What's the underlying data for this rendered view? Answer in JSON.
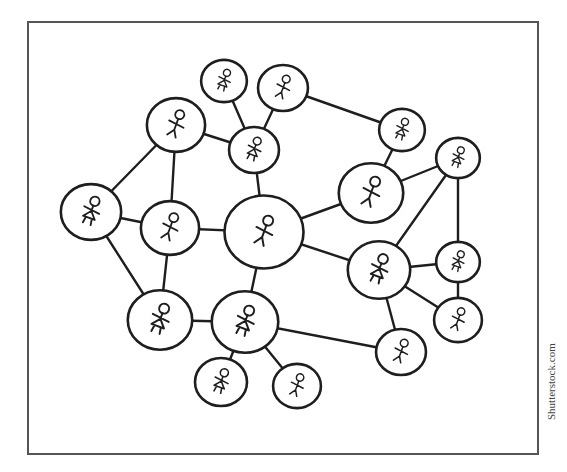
{
  "diagram": {
    "title": "",
    "frame": {
      "x": 28,
      "y": 22,
      "width": 510,
      "height": 432
    },
    "colors": {
      "ink": "#1e1e1e",
      "frame": "#555555",
      "background": "#ffffff"
    },
    "nodes": [
      {
        "id": "A",
        "x": 176,
        "y": 125,
        "r": 28,
        "figure": "male"
      },
      {
        "id": "B",
        "x": 224,
        "y": 81,
        "r": 22,
        "figure": "female"
      },
      {
        "id": "C",
        "x": 283,
        "y": 88,
        "r": 24,
        "figure": "male"
      },
      {
        "id": "D",
        "x": 254,
        "y": 150,
        "r": 24,
        "figure": "female"
      },
      {
        "id": "E",
        "x": 402,
        "y": 130,
        "r": 22,
        "figure": "female"
      },
      {
        "id": "F",
        "x": 371,
        "y": 193,
        "r": 31,
        "figure": "male"
      },
      {
        "id": "G",
        "x": 458,
        "y": 158,
        "r": 21,
        "figure": "female"
      },
      {
        "id": "H",
        "x": 91,
        "y": 212,
        "r": 29,
        "figure": "female"
      },
      {
        "id": "I",
        "x": 170,
        "y": 228,
        "r": 28,
        "figure": "male"
      },
      {
        "id": "J",
        "x": 264,
        "y": 232,
        "r": 38,
        "figure": "male"
      },
      {
        "id": "K",
        "x": 379,
        "y": 270,
        "r": 30,
        "figure": "female"
      },
      {
        "id": "L",
        "x": 458,
        "y": 262,
        "r": 21,
        "figure": "female"
      },
      {
        "id": "M",
        "x": 458,
        "y": 320,
        "r": 23,
        "figure": "male"
      },
      {
        "id": "N",
        "x": 160,
        "y": 320,
        "r": 31,
        "figure": "female"
      },
      {
        "id": "O",
        "x": 245,
        "y": 322,
        "r": 32,
        "figure": "female"
      },
      {
        "id": "P",
        "x": 401,
        "y": 352,
        "r": 24,
        "figure": "male"
      },
      {
        "id": "Q",
        "x": 221,
        "y": 382,
        "r": 25,
        "figure": "female"
      },
      {
        "id": "R",
        "x": 297,
        "y": 386,
        "r": 23,
        "figure": "male"
      }
    ],
    "edges": [
      [
        "A",
        "H"
      ],
      [
        "A",
        "I"
      ],
      [
        "A",
        "D"
      ],
      [
        "B",
        "D"
      ],
      [
        "C",
        "D"
      ],
      [
        "C",
        "E"
      ],
      [
        "D",
        "J"
      ],
      [
        "E",
        "F"
      ],
      [
        "H",
        "I"
      ],
      [
        "H",
        "N"
      ],
      [
        "I",
        "J"
      ],
      [
        "I",
        "N"
      ],
      [
        "J",
        "F"
      ],
      [
        "J",
        "K"
      ],
      [
        "J",
        "O"
      ],
      [
        "F",
        "G"
      ],
      [
        "G",
        "K"
      ],
      [
        "G",
        "L"
      ],
      [
        "K",
        "L"
      ],
      [
        "K",
        "M"
      ],
      [
        "K",
        "P"
      ],
      [
        "L",
        "M"
      ],
      [
        "N",
        "O"
      ],
      [
        "O",
        "Q"
      ],
      [
        "O",
        "R"
      ],
      [
        "O",
        "P"
      ]
    ]
  },
  "credit": "Shutterstock.com"
}
